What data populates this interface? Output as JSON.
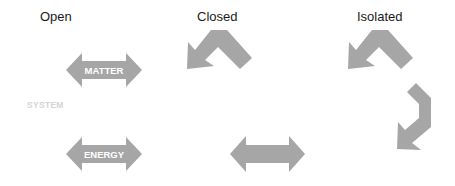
{
  "columns": {
    "open": {
      "title": "Open"
    },
    "closed": {
      "title": "Closed"
    },
    "isolated": {
      "title": "Isolated"
    }
  },
  "system_label": "SYSTEM",
  "arrows": {
    "matter": {
      "label": "MATTER",
      "type": "double-headed"
    },
    "energy": {
      "label": "ENERGY",
      "type": "double-headed"
    },
    "closed_energy": {
      "label": "",
      "type": "double-headed"
    },
    "closed_matter": {
      "label": "",
      "type": "bent-returning"
    },
    "isolated_top": {
      "label": "",
      "type": "bent-returning"
    },
    "isolated_side": {
      "label": "",
      "type": "bent-returning"
    }
  },
  "colors": {
    "arrow_fill": "#a6a6a6",
    "arrow_text": "#ffffff",
    "title_text": "#1a1a1a",
    "system_text": "#d4d4d4",
    "background": "#ffffff"
  }
}
